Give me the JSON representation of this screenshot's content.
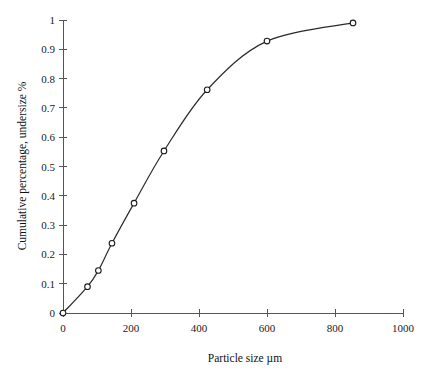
{
  "chart_data": {
    "type": "line",
    "title": "",
    "xlabel": "Particle size µm",
    "ylabel": "Cumulative percentage, undersize %",
    "xlim": [
      0,
      1000
    ],
    "ylim": [
      0,
      1
    ],
    "xticks": [
      0,
      200,
      400,
      600,
      800,
      1000
    ],
    "xticklabels": [
      "0",
      "200",
      "400",
      "600",
      "800",
      "1000"
    ],
    "yticks": [
      0,
      0.1,
      0.2,
      0.3,
      0.4,
      0.5,
      0.6,
      0.7,
      0.8,
      0.9,
      1
    ],
    "yticklabels": [
      "0",
      "0.1",
      "0.2",
      "0.3",
      "0.4",
      "0.5",
      "0.6",
      "0.7",
      "0.8",
      "0.9",
      "1"
    ],
    "grid": false,
    "legend": null,
    "marker": "open-circle",
    "line_color": "#2b2b2b",
    "marker_face_color": "#ffffff",
    "marker_edge_color": "#1a1a1a",
    "axis_color": "#555555",
    "x": [
      0,
      72,
      104,
      144,
      209,
      297,
      424,
      600,
      853
    ],
    "y": [
      0,
      0.09,
      0.145,
      0.238,
      0.375,
      0.553,
      0.762,
      0.928,
      0.99
    ],
    "series": [
      {
        "name": "Cumulative undersize",
        "points": [
          {
            "x": 0,
            "y": 0
          },
          {
            "x": 72,
            "y": 0.09
          },
          {
            "x": 104,
            "y": 0.145
          },
          {
            "x": 144,
            "y": 0.238
          },
          {
            "x": 209,
            "y": 0.375
          },
          {
            "x": 297,
            "y": 0.553
          },
          {
            "x": 424,
            "y": 0.762
          },
          {
            "x": 600,
            "y": 0.928
          },
          {
            "x": 853,
            "y": 0.99
          }
        ]
      }
    ]
  }
}
